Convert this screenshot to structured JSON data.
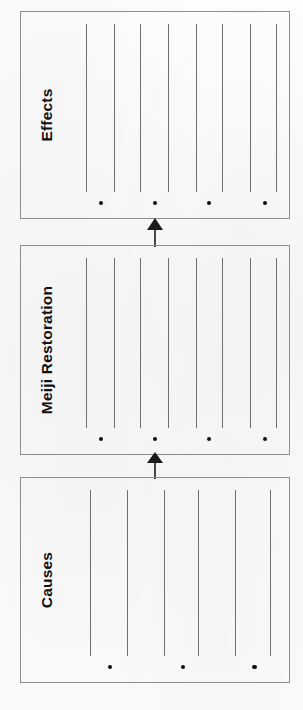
{
  "document": {
    "type": "graphic-organizer-worksheet",
    "orientation": "rotated-90-counterclockwise",
    "background_color": "#fbfbfb",
    "ink_color": "#111111",
    "box_border_color": "#8d8d8d",
    "rule_line_color": "#6f6f6f"
  },
  "flow": {
    "direction": "bottom-to-top",
    "sequence": [
      "Causes",
      "Meiji Restoration",
      "Effects"
    ],
    "arrow_icon": "up-arrow-icon",
    "arrow_count": 2
  },
  "boxes": [
    {
      "id": "effects",
      "label": "Effects",
      "position": "top",
      "rule_line_count": 8,
      "bullet_count": 4,
      "rule_positions_pct": [
        6,
        19,
        31,
        44,
        57,
        69,
        82,
        94
      ],
      "bullet_positions_pct": [
        12,
        37,
        62,
        88
      ]
    },
    {
      "id": "meiji-restoration",
      "label": "Meiji Restoration",
      "position": "middle",
      "rule_line_count": 8,
      "bullet_count": 4,
      "rule_positions_pct": [
        6,
        19,
        31,
        44,
        57,
        69,
        82,
        94
      ],
      "bullet_positions_pct": [
        12,
        37,
        62,
        88
      ]
    },
    {
      "id": "causes",
      "label": "Causes",
      "position": "bottom",
      "rule_line_count": 6,
      "bullet_count": 3,
      "rule_positions_pct": [
        8,
        25,
        42,
        58,
        75,
        91
      ],
      "bullet_positions_pct": [
        16,
        50,
        83
      ]
    }
  ],
  "connectors": [
    {
      "id": "arrow-causes-to-meiji",
      "from": "causes",
      "to": "meiji-restoration",
      "icon": "up-arrow-icon"
    },
    {
      "id": "arrow-meiji-to-effects",
      "from": "meiji-restoration",
      "to": "effects",
      "icon": "up-arrow-icon"
    }
  ]
}
